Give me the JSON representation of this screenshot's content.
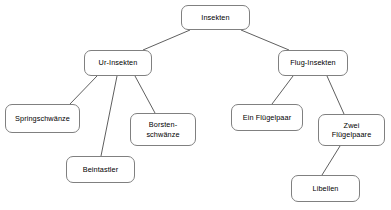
{
  "diagram": {
    "type": "tree",
    "canvas": {
      "width": 391,
      "height": 210,
      "background": "#ffffff"
    },
    "style": {
      "node_border_color": "#808080",
      "node_fill_color": "#ffffff",
      "edge_color": "#4d4d4d",
      "text_color": "#000000"
    },
    "nodes": [
      {
        "id": "insekten",
        "label": "Insekten",
        "level": 0,
        "x": 181,
        "y": 5,
        "w": 69,
        "h": 25
      },
      {
        "id": "ur-insekten",
        "label": "Ur-Insekten",
        "level": 1,
        "x": 84,
        "y": 50,
        "w": 68,
        "h": 26
      },
      {
        "id": "flug-insekten",
        "label": "Flug-Insekten",
        "level": 1,
        "x": 278,
        "y": 50,
        "w": 70,
        "h": 26
      },
      {
        "id": "springschwaenze",
        "label": "Springschwänze",
        "level": 2,
        "x": 5,
        "y": 104,
        "w": 75,
        "h": 29
      },
      {
        "id": "beintastler",
        "label": "Beintastler",
        "level": 2,
        "x": 66,
        "y": 156,
        "w": 69,
        "h": 27
      },
      {
        "id": "borstenschwaenze",
        "label": "Borsten-\nschwänze",
        "level": 2,
        "x": 130,
        "y": 113,
        "w": 66,
        "h": 33
      },
      {
        "id": "ein-fluegelpaar",
        "label": "Ein Flügelpaar",
        "level": 2,
        "x": 231,
        "y": 104,
        "w": 72,
        "h": 27
      },
      {
        "id": "zwei-fluegelpaare",
        "label": "Zwei\nFlügelpaare",
        "level": 2,
        "x": 318,
        "y": 114,
        "w": 67,
        "h": 32
      },
      {
        "id": "libellen",
        "label": "Libellen",
        "level": 3,
        "x": 291,
        "y": 175,
        "w": 69,
        "h": 27
      }
    ],
    "edges": [
      {
        "from": "insekten",
        "to": "ur-insekten",
        "x1": 190,
        "y1": 30,
        "x2": 143,
        "y2": 50
      },
      {
        "from": "insekten",
        "to": "flug-insekten",
        "x1": 241,
        "y1": 30,
        "x2": 289,
        "y2": 50
      },
      {
        "from": "ur-insekten",
        "to": "springschwaenze",
        "x1": 97,
        "y1": 76,
        "x2": 70,
        "y2": 104
      },
      {
        "from": "ur-insekten",
        "to": "beintastler",
        "x1": 117,
        "y1": 76,
        "x2": 101,
        "y2": 156
      },
      {
        "from": "ur-insekten",
        "to": "borstenschwaenze",
        "x1": 135,
        "y1": 76,
        "x2": 155,
        "y2": 113
      },
      {
        "from": "flug-insekten",
        "to": "ein-fluegelpaar",
        "x1": 293,
        "y1": 76,
        "x2": 272,
        "y2": 104
      },
      {
        "from": "flug-insekten",
        "to": "zwei-fluegelpaare",
        "x1": 327,
        "y1": 76,
        "x2": 344,
        "y2": 114
      },
      {
        "from": "zwei-fluegelpaare",
        "to": "libellen",
        "x1": 340,
        "y1": 146,
        "x2": 322,
        "y2": 175
      }
    ]
  }
}
